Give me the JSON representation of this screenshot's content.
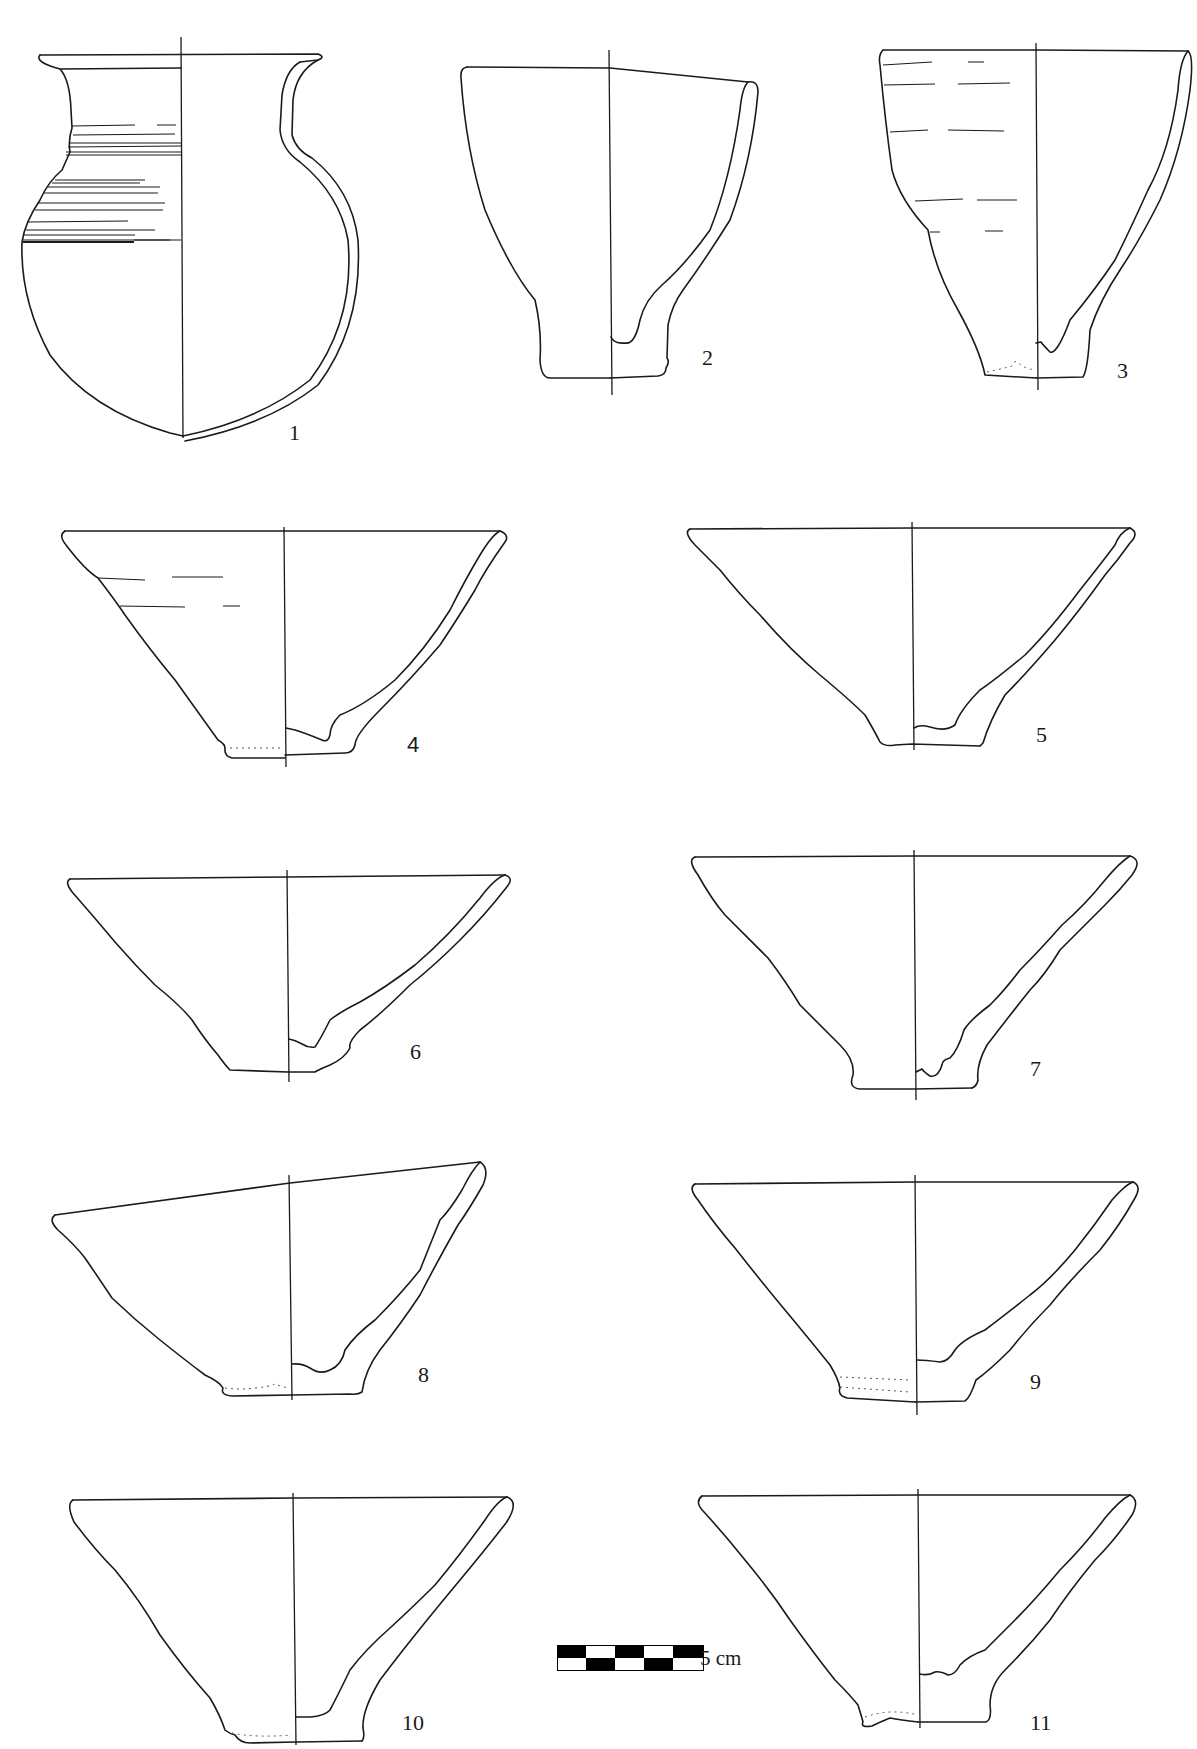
{
  "plate": {
    "type": "archaeological pottery profile drawings",
    "background": "#ffffff",
    "line_color": "#1a1a1a"
  },
  "figures": [
    {
      "number": "1",
      "form": "globular jar with flared rim, incised horizontal bands on shoulder"
    },
    {
      "number": "2",
      "form": "deep cup with ring foot"
    },
    {
      "number": "3",
      "form": "deep conical cup with wheel marks"
    },
    {
      "number": "4",
      "form": "conical bowl with ring foot, wheel marks"
    },
    {
      "number": "5",
      "form": "conical bowl"
    },
    {
      "number": "6",
      "form": "conical bowl"
    },
    {
      "number": "7",
      "form": "conical bowl with ring foot"
    },
    {
      "number": "8",
      "form": "conical bowl, tilted rim"
    },
    {
      "number": "9",
      "form": "conical bowl"
    },
    {
      "number": "10",
      "form": "conical bowl"
    },
    {
      "number": "11",
      "form": "conical bowl"
    }
  ],
  "scale_bar": {
    "label": "5 cm",
    "segments": 5,
    "colors": [
      "#000000",
      "#ffffff"
    ]
  }
}
